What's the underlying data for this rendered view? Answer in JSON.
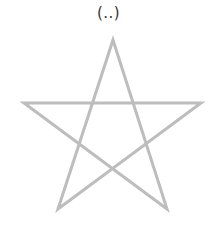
{
  "caption": "(..)",
  "figure": {
    "shape": "pentagram",
    "stroke_color": "#bdbdbd",
    "stroke_width": 3,
    "points": [
      [
        113,
        40
      ],
      [
        167,
        209
      ],
      [
        24,
        103
      ],
      [
        201,
        103
      ],
      [
        58,
        209
      ]
    ]
  }
}
